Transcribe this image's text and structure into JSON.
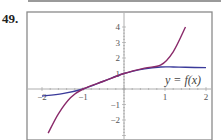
{
  "problem": {
    "number": "49."
  },
  "chart_data": {
    "type": "line",
    "title": "",
    "xlabel": "",
    "ylabel": "",
    "xlim": [
      -2.1,
      2.1
    ],
    "ylim": [
      -3,
      4.3
    ],
    "grid": false,
    "x_ticks": [
      -2,
      -1,
      1,
      2
    ],
    "x_tick_labels": [
      "−2",
      "−1",
      "1",
      "2"
    ],
    "y_ticks": [
      -2,
      -1,
      1,
      2,
      3,
      4
    ],
    "y_tick_labels": [
      "−2",
      "−1",
      "1",
      "2",
      "3",
      "4"
    ],
    "annotation": "y = f(x)",
    "series": [
      {
        "name": "y = f(x)",
        "color": "#3a3a9a",
        "x": [
          -2,
          -1.5,
          -1,
          -0.5,
          0,
          0.5,
          0.9,
          1.2,
          1.5,
          2
        ],
        "y": [
          -0.45,
          -0.3,
          0,
          0.5,
          1,
          1.3,
          1.42,
          1.42,
          1.4,
          1.38
        ]
      },
      {
        "name": "approximating polynomial",
        "color": "#8a2a6a",
        "x": [
          -1.85,
          -1.6,
          -1.3,
          -1,
          -0.5,
          0,
          0.5,
          0.9,
          1.2,
          1.5
        ],
        "y": [
          -2.85,
          -1.6,
          -0.55,
          0,
          0.5,
          1,
          1.35,
          1.55,
          2.4,
          4
        ]
      }
    ]
  }
}
